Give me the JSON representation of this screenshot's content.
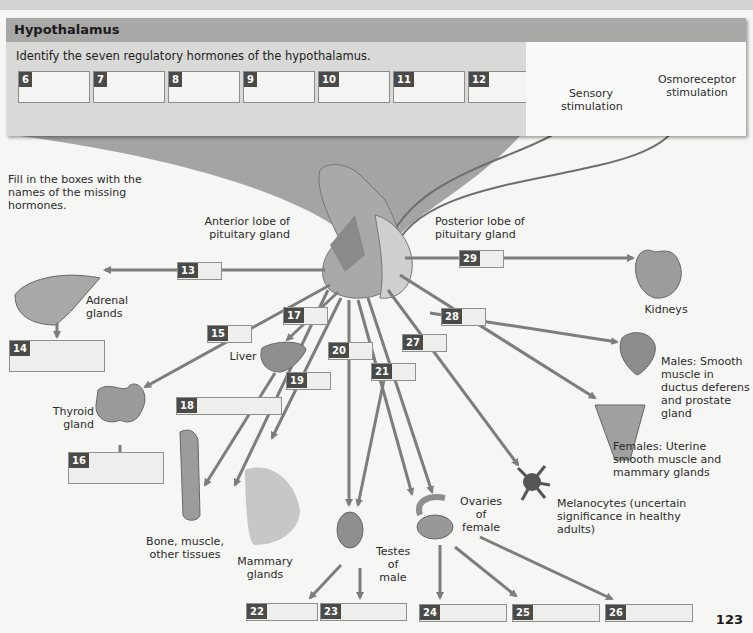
{
  "panel": {
    "title": "Hypothalamus",
    "instruction": "Identify the seven regulatory hormones of the hypothalamus.",
    "boxes": [
      {
        "num": "6",
        "value": ""
      },
      {
        "num": "7",
        "value": ""
      },
      {
        "num": "8",
        "value": ""
      },
      {
        "num": "9",
        "value": ""
      },
      {
        "num": "10",
        "value": ""
      },
      {
        "num": "11",
        "value": ""
      },
      {
        "num": "12",
        "value": ""
      }
    ],
    "sensory_label": "Sensory stimulation",
    "osmo_label": "Osmoreceptor stimulation"
  },
  "instruction2": "Fill in the boxes with the names of the missing hormones.",
  "labels": {
    "anterior": "Anterior lobe of pituitary gland",
    "posterior": "Posterior lobe of pituitary gland",
    "adrenal": "Adrenal glands",
    "kidneys": "Kidneys",
    "liver": "Liver",
    "thyroid": "Thyroid gland",
    "bone": "Bone, muscle, other tissues",
    "mammary": "Mammary glands",
    "testes": "Testes of male",
    "ovaries": "Ovaries of female",
    "melanocytes": "Melanocytes (uncertain significance in healthy adults)",
    "males": "Males: Smooth muscle in ductus deferens and prostate gland",
    "females": "Females: Uterine smooth muscle and mammary glands"
  },
  "answer_boxes": {
    "b13": {
      "num": "13",
      "value": ""
    },
    "b14": {
      "num": "14",
      "value": ""
    },
    "b15": {
      "num": "15",
      "value": ""
    },
    "b16": {
      "num": "16",
      "value": ""
    },
    "b17": {
      "num": "17",
      "value": ""
    },
    "b18": {
      "num": "18",
      "value": ""
    },
    "b19": {
      "num": "19",
      "value": ""
    },
    "b20": {
      "num": "20",
      "value": ""
    },
    "b21": {
      "num": "21",
      "value": ""
    },
    "b22": {
      "num": "22",
      "value": ""
    },
    "b23": {
      "num": "23",
      "value": ""
    },
    "b24": {
      "num": "24",
      "value": ""
    },
    "b25": {
      "num": "25",
      "value": ""
    },
    "b26": {
      "num": "26",
      "value": ""
    },
    "b27": {
      "num": "27",
      "value": ""
    },
    "b28": {
      "num": "28",
      "value": ""
    },
    "b29": {
      "num": "29",
      "value": ""
    }
  },
  "page_number": "123",
  "colors": {
    "arrow": "#7d7d7b",
    "number_tag": "#4a4a48",
    "panel": "#d9d9d7",
    "panel_header": "#a8a8a6"
  }
}
